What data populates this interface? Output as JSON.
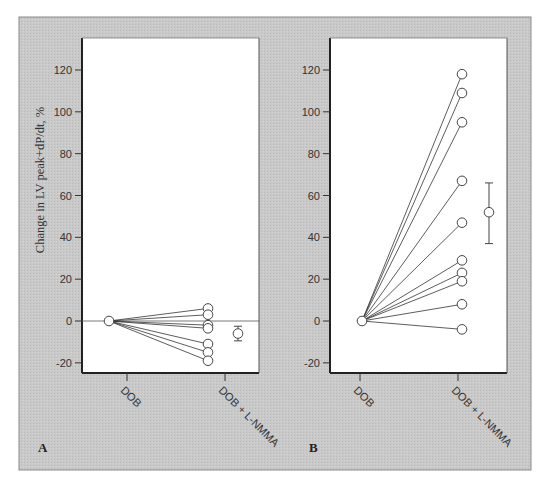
{
  "figure": {
    "background": "#c8c8c8",
    "plot_background": "#ffffff",
    "ylabel": "Change in LV peak+dP/dt, %"
  },
  "chart_data": [
    {
      "type": "line",
      "panel": "A",
      "title": "",
      "xlabel": "",
      "ylabel": "Change in LV peak+dP/dt, %",
      "categories": [
        "DOB",
        "DOB + L-NMMA"
      ],
      "yticks": [
        -20,
        0,
        20,
        40,
        60,
        80,
        100,
        120
      ],
      "ylim": [
        -29,
        130
      ],
      "grid": false,
      "zero_line": true,
      "subjects": [
        {
          "values": [
            0,
            6
          ]
        },
        {
          "values": [
            0,
            3
          ]
        },
        {
          "values": [
            0,
            -2
          ]
        },
        {
          "values": [
            0,
            -3.5
          ]
        },
        {
          "values": [
            0,
            -11
          ]
        },
        {
          "values": [
            0,
            -15
          ]
        },
        {
          "values": [
            0,
            -19
          ]
        }
      ],
      "mean": {
        "value": -6,
        "error_low": -9.5,
        "error_high": -2.5
      }
    },
    {
      "type": "line",
      "panel": "B",
      "title": "",
      "xlabel": "",
      "ylabel": "",
      "categories": [
        "DOB",
        "DOB + L-NMMA"
      ],
      "yticks": [
        -20,
        0,
        20,
        40,
        60,
        80,
        100,
        120
      ],
      "ylim": [
        -29,
        130
      ],
      "grid": false,
      "zero_line": false,
      "subjects": [
        {
          "values": [
            0,
            118
          ]
        },
        {
          "values": [
            0,
            109
          ]
        },
        {
          "values": [
            0,
            95
          ]
        },
        {
          "values": [
            0,
            67
          ]
        },
        {
          "values": [
            0,
            47
          ]
        },
        {
          "values": [
            0,
            29
          ]
        },
        {
          "values": [
            0,
            23
          ]
        },
        {
          "values": [
            0,
            19
          ]
        },
        {
          "values": [
            0,
            8
          ]
        },
        {
          "values": [
            0,
            -4
          ]
        }
      ],
      "mean": {
        "value": 52,
        "error_low": 37,
        "error_high": 66
      }
    }
  ]
}
